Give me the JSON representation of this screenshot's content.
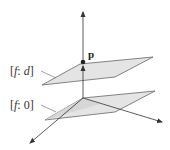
{
  "diagram": {
    "point_label": "p",
    "planes": [
      {
        "id": "upper",
        "label_open": "[",
        "label_f": "f",
        "label_sep": ": ",
        "label_val": "d",
        "label_close": "]"
      },
      {
        "id": "lower",
        "label_open": "[",
        "label_f": "f",
        "label_sep": ": ",
        "label_val": "0",
        "label_close": "]"
      }
    ],
    "colors": {
      "plane_fill": "#e4e4e4",
      "line": "#555555",
      "axis": "#333333"
    }
  }
}
